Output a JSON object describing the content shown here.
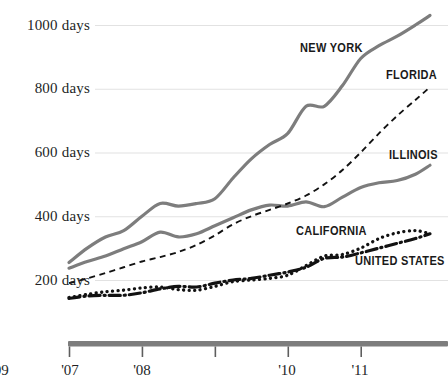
{
  "chart_data": {
    "type": "line",
    "title": "",
    "subtitle": "",
    "xlabel": "",
    "ylabel": "",
    "unit": "days",
    "xlim": [
      2007.0,
      2011.95
    ],
    "ylim": [
      100,
      1060
    ],
    "grid": "horizontal",
    "legend": "inline-labels",
    "yticks": [
      200,
      400,
      600,
      800,
      1000
    ],
    "ytick_labels": [
      "200 days",
      "400 days",
      "600 days",
      "800 days",
      "1000 days"
    ],
    "xticks": [
      2007,
      2008,
      2009,
      2010,
      2011
    ],
    "xtick_labels": [
      "'07",
      "'08",
      "'09",
      "'10",
      "'11"
    ],
    "x": [
      2007.0,
      2007.25,
      2007.5,
      2007.75,
      2008.0,
      2008.25,
      2008.5,
      2008.75,
      2009.0,
      2009.25,
      2009.5,
      2009.75,
      2010.0,
      2010.25,
      2010.5,
      2010.75,
      2011.0,
      2011.25,
      2011.5,
      2011.75,
      2011.95
    ],
    "series": [
      {
        "name": "NEW YORK",
        "style": "solid-gray",
        "color": "#7d7d7d",
        "values": [
          255,
          300,
          335,
          355,
          400,
          440,
          432,
          440,
          455,
          520,
          580,
          625,
          660,
          745,
          745,
          810,
          895,
          935,
          965,
          1000,
          1030
        ]
      },
      {
        "name": "FLORIDA",
        "style": "dashed-black",
        "color": "#121212",
        "values": [
          190,
          205,
          222,
          240,
          258,
          272,
          288,
          310,
          340,
          375,
          400,
          420,
          440,
          465,
          500,
          545,
          600,
          660,
          715,
          765,
          805
        ]
      },
      {
        "name": "ILLINOIS",
        "style": "solid-gray",
        "color": "#7d7d7d",
        "values": [
          237,
          258,
          275,
          298,
          320,
          350,
          335,
          345,
          370,
          395,
          420,
          435,
          432,
          445,
          430,
          460,
          490,
          505,
          512,
          532,
          560
        ]
      },
      {
        "name": "CALIFORNIA",
        "style": "dotted-black",
        "color": "#121212",
        "values": [
          145,
          155,
          163,
          168,
          175,
          178,
          170,
          168,
          180,
          195,
          200,
          205,
          215,
          245,
          275,
          280,
          300,
          330,
          348,
          355,
          345
        ]
      },
      {
        "name": "UNITED STATES",
        "style": "dash-dot-black",
        "color": "#121212",
        "values": [
          142,
          150,
          152,
          152,
          160,
          172,
          180,
          178,
          190,
          200,
          205,
          215,
          225,
          240,
          268,
          272,
          285,
          300,
          315,
          330,
          345
        ]
      }
    ],
    "series_label_positions": [
      {
        "name": "NEW YORK",
        "x": 300,
        "y": 41
      },
      {
        "name": "FLORIDA",
        "x": 386,
        "y": 68
      },
      {
        "name": "ILLINOIS",
        "x": 389,
        "y": 148
      },
      {
        "name": "CALIFORNIA",
        "x": 296,
        "y": 224
      },
      {
        "name": "UNITED STATES",
        "x": 355,
        "y": 254
      }
    ]
  },
  "axis": {
    "bar_color": "#7d7d7d",
    "grid_color": "#e2e2e2"
  }
}
